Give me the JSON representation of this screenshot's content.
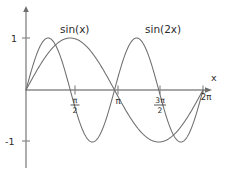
{
  "figure": {
    "background_color": "#ffffff",
    "curve_color": "#6e6e6e",
    "axis_color": "#8a8a8a",
    "text_color": "#2b2b2b"
  },
  "labels": {
    "curve1": "sin(x)",
    "curve2": "sin(2x)",
    "x_axis_name": "x",
    "y_tick_pos": "1",
    "y_tick_neg": "-1",
    "tick_pi_half_num": "π",
    "tick_pi_half_den": "2",
    "tick_pi": "π",
    "tick_3pi_half_num": "3π",
    "tick_3pi_half_den": "2",
    "tick_2pi": "2π"
  },
  "chart_data": {
    "type": "line",
    "title": "",
    "xlabel": "x",
    "ylabel": "",
    "xlim": [
      0,
      6.283185307179586
    ],
    "ylim": [
      -1.35,
      1.35
    ],
    "grid": false,
    "legend": "inline-annotations",
    "xticks": [
      1.5707963267948966,
      3.141592653589793,
      4.71238898038469,
      6.283185307179586
    ],
    "xticklabels": [
      "π/2",
      "π",
      "3π/2",
      "2π"
    ],
    "yticks": [
      -1,
      1
    ],
    "yticklabels": [
      "-1",
      "1"
    ],
    "series": [
      {
        "name": "sin(x)",
        "formula": "y = sin(x)",
        "x": [
          0,
          0.3926990817,
          0.7853981634,
          1.1780972451,
          1.5707963268,
          1.9634954085,
          2.3561944902,
          2.7488935719,
          3.1415926536,
          3.5342917353,
          3.926990817,
          4.3196898987,
          4.7123889804,
          5.1050880621,
          5.4977871438,
          5.8904862255,
          6.2831853072
        ],
        "y": [
          0,
          0.3826834324,
          0.7071067812,
          0.9238795325,
          1,
          0.9238795325,
          0.7071067812,
          0.3826834324,
          0,
          -0.3826834324,
          -0.7071067812,
          -0.9238795325,
          -1,
          -0.9238795325,
          -0.7071067812,
          -0.3826834324,
          0
        ]
      },
      {
        "name": "sin(2x)",
        "formula": "y = sin(2x)",
        "x": [
          0,
          0.3926990817,
          0.7853981634,
          1.1780972451,
          1.5707963268,
          1.9634954085,
          2.3561944902,
          2.7488935719,
          3.1415926536,
          3.5342917353,
          3.926990817,
          4.3196898987,
          4.7123889804,
          5.1050880621,
          5.4977871438,
          5.8904862255,
          6.2831853072
        ],
        "y": [
          0,
          0.7071067812,
          1,
          0.7071067812,
          0,
          -0.7071067812,
          -1,
          -0.7071067812,
          0,
          0.7071067812,
          1,
          0.7071067812,
          0,
          -0.7071067812,
          -1,
          -0.7071067812,
          0
        ]
      }
    ],
    "annotations": [
      {
        "text": "sin(x)",
        "x": 1.55,
        "y": 1.28
      },
      {
        "text": "sin(2x)",
        "x": 3.95,
        "y": 1.28
      }
    ]
  }
}
